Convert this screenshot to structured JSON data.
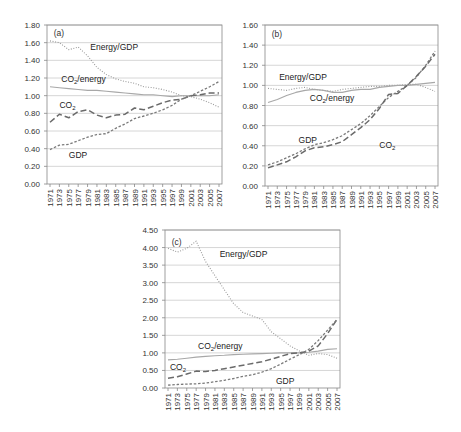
{
  "chart_data": [
    {
      "type": "line",
      "title": "(a)",
      "panel_label": "(a)",
      "xlabel": "",
      "ylabel": "",
      "ylim": [
        0,
        1.8
      ],
      "yticks": [
        "0.00",
        "0.20",
        "0.40",
        "0.60",
        "0.80",
        "1.00",
        "1.20",
        "1.40",
        "1.60",
        "1.80"
      ],
      "xticks": [
        "1971",
        "1973",
        "1975",
        "1977",
        "1979",
        "1981",
        "1983",
        "1985",
        "1987",
        "1989",
        "1991",
        "1993",
        "1995",
        "1997",
        "1999",
        "2001",
        "2003",
        "2005",
        "2007"
      ],
      "grid": true,
      "x": [
        1971,
        1973,
        1975,
        1977,
        1979,
        1981,
        1983,
        1985,
        1987,
        1989,
        1991,
        1993,
        1995,
        1997,
        1999,
        2001,
        2003,
        2005,
        2007
      ],
      "series": [
        {
          "name": "Energy/GDP",
          "style": "dotted",
          "values": [
            1.62,
            1.6,
            1.52,
            1.55,
            1.45,
            1.32,
            1.24,
            1.19,
            1.16,
            1.14,
            1.1,
            1.09,
            1.07,
            1.04,
            1.0,
            0.99,
            0.96,
            0.92,
            0.87
          ]
        },
        {
          "name": "CO2/energy",
          "style": "solid",
          "values": [
            1.1,
            1.09,
            1.08,
            1.07,
            1.06,
            1.06,
            1.05,
            1.04,
            1.03,
            1.02,
            1.01,
            1.01,
            1.0,
            0.99,
            1.0,
            1.0,
            1.0,
            1.0,
            1.01
          ]
        },
        {
          "name": "CO2",
          "style": "dashed",
          "values": [
            0.7,
            0.79,
            0.75,
            0.82,
            0.84,
            0.78,
            0.75,
            0.78,
            0.79,
            0.86,
            0.84,
            0.88,
            0.92,
            0.95,
            0.96,
            1.0,
            1.01,
            1.03,
            1.03
          ]
        },
        {
          "name": "GDP",
          "style": "short-dashed",
          "values": [
            0.39,
            0.44,
            0.45,
            0.49,
            0.53,
            0.56,
            0.57,
            0.63,
            0.68,
            0.74,
            0.77,
            0.8,
            0.84,
            0.89,
            0.96,
            1.0,
            1.05,
            1.1,
            1.16
          ]
        }
      ],
      "annotations": [
        "Energy/GDP",
        "CO2/energy",
        "CO2",
        "GDP"
      ]
    },
    {
      "type": "line",
      "title": "(b)",
      "panel_label": "(b)",
      "xlabel": "",
      "ylabel": "",
      "ylim": [
        0,
        1.6
      ],
      "yticks": [
        "0.00",
        "0.20",
        "0.40",
        "0.60",
        "0.80",
        "1.00",
        "1.20",
        "1.40",
        "1.60"
      ],
      "xticks": [
        "1971",
        "1973",
        "1975",
        "1977",
        "1979",
        "1981",
        "1983",
        "1985",
        "1987",
        "1989",
        "1991",
        "1993",
        "1995",
        "1997",
        "1999",
        "2001",
        "2003",
        "2005",
        "2007"
      ],
      "grid": true,
      "x": [
        1971,
        1973,
        1975,
        1977,
        1979,
        1981,
        1983,
        1985,
        1987,
        1989,
        1991,
        1993,
        1995,
        1997,
        1999,
        2001,
        2003,
        2005,
        2007
      ],
      "series": [
        {
          "name": "Energy/GDP",
          "style": "dotted",
          "values": [
            0.97,
            0.96,
            0.95,
            0.97,
            0.98,
            0.96,
            0.95,
            0.94,
            0.96,
            0.97,
            0.98,
            0.99,
            0.99,
            1.0,
            1.0,
            1.01,
            1.01,
            0.98,
            0.94
          ]
        },
        {
          "name": "CO2/energy",
          "style": "solid",
          "values": [
            0.83,
            0.86,
            0.9,
            0.93,
            0.95,
            0.96,
            0.95,
            0.93,
            0.93,
            0.95,
            0.96,
            0.96,
            0.98,
            0.99,
            1.0,
            1.0,
            1.01,
            1.02,
            1.03
          ]
        },
        {
          "name": "GDP",
          "style": "short-dashed",
          "values": [
            0.21,
            0.24,
            0.28,
            0.32,
            0.37,
            0.41,
            0.43,
            0.46,
            0.5,
            0.56,
            0.62,
            0.7,
            0.79,
            0.88,
            0.94,
            1.0,
            1.08,
            1.2,
            1.34
          ]
        },
        {
          "name": "CO2",
          "style": "dashed",
          "values": [
            0.18,
            0.21,
            0.24,
            0.29,
            0.35,
            0.38,
            0.39,
            0.41,
            0.44,
            0.51,
            0.58,
            0.66,
            0.77,
            0.91,
            0.92,
            1.0,
            1.09,
            1.19,
            1.31
          ]
        }
      ],
      "annotations": [
        "Energy/GDP",
        "CO2/energy",
        "GDP",
        "CO2"
      ]
    },
    {
      "type": "line",
      "title": "(c)",
      "panel_label": "(c)",
      "xlabel": "",
      "ylabel": "",
      "ylim": [
        0,
        4.5
      ],
      "yticks": [
        "0.00",
        "0.50",
        "1.00",
        "1.50",
        "2.00",
        "2.50",
        "3.00",
        "3.50",
        "4.00",
        "4.50"
      ],
      "xticks": [
        "1971",
        "1973",
        "1975",
        "1977",
        "1979",
        "1981",
        "1983",
        "1985",
        "1987",
        "1989",
        "1991",
        "1993",
        "1995",
        "1997",
        "1999",
        "2001",
        "2003",
        "2005",
        "2007"
      ],
      "grid": true,
      "x": [
        1971,
        1973,
        1975,
        1977,
        1979,
        1981,
        1983,
        1985,
        1987,
        1989,
        1991,
        1993,
        1995,
        1997,
        1999,
        2001,
        2003,
        2005,
        2007
      ],
      "series": [
        {
          "name": "Energy/GDP",
          "style": "dotted",
          "values": [
            3.98,
            3.87,
            3.98,
            4.18,
            3.6,
            3.2,
            2.8,
            2.4,
            2.15,
            2.05,
            1.95,
            1.6,
            1.4,
            1.2,
            1.05,
            0.93,
            0.98,
            0.95,
            0.85
          ]
        },
        {
          "name": "CO2/energy",
          "style": "solid",
          "values": [
            0.8,
            0.82,
            0.85,
            0.88,
            0.9,
            0.92,
            0.93,
            0.95,
            0.96,
            0.97,
            0.98,
            0.99,
            1.0,
            1.0,
            1.0,
            1.02,
            1.05,
            1.1,
            1.12
          ]
        },
        {
          "name": "CO2",
          "style": "dashed",
          "values": [
            0.28,
            0.32,
            0.4,
            0.48,
            0.47,
            0.5,
            0.55,
            0.6,
            0.65,
            0.7,
            0.75,
            0.82,
            0.9,
            0.98,
            1.0,
            1.05,
            1.2,
            1.55,
            1.95
          ]
        },
        {
          "name": "GDP",
          "style": "short-dashed",
          "values": [
            0.08,
            0.1,
            0.11,
            0.12,
            0.14,
            0.18,
            0.22,
            0.27,
            0.33,
            0.38,
            0.45,
            0.55,
            0.68,
            0.82,
            0.95,
            1.1,
            1.35,
            1.65,
            1.95
          ]
        }
      ],
      "annotations": [
        "Energy/GDP",
        "CO2/energy",
        "CO2",
        "GDP"
      ]
    }
  ],
  "labels": {
    "a": {
      "panel": "(a)",
      "energy_gdp": "Energy/GDP",
      "co2_energy_pre": "CO",
      "co2_energy_sub": "2",
      "co2_energy_post": "/energy",
      "co2_pre": "CO",
      "co2_sub": "2",
      "gdp": "GDP"
    },
    "b": {
      "panel": "(b)",
      "energy_gdp": "Energy/GDP",
      "co2_energy_pre": "CO",
      "co2_energy_sub": "2",
      "co2_energy_post": "/energy",
      "co2_pre": "CO",
      "co2_sub": "2",
      "gdp": "GDP"
    },
    "c": {
      "panel": "(c)",
      "energy_gdp": "Energy/GDP",
      "co2_energy_pre": "CO",
      "co2_energy_sub": "2",
      "co2_energy_post": "/energy",
      "co2_pre": "CO",
      "co2_sub": "2",
      "gdp": "GDP"
    }
  },
  "colors": {
    "axis": "#888888",
    "grid": "#cccccc",
    "energy_gdp": "#9a9a9a",
    "co2_energy": "#a8a8a8",
    "co2": "#6a6a6a",
    "gdp": "#7a7a7a"
  }
}
